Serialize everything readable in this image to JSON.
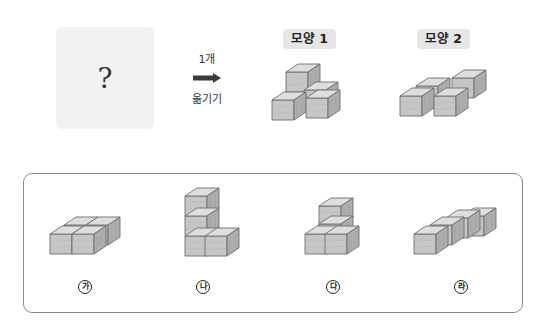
{
  "problem": {
    "question_box": {
      "text": "?"
    },
    "operation": {
      "count_label": "1개",
      "action_label": "옮기기",
      "arrow_icon": "right-arrow"
    },
    "shapes": [
      {
        "label": "모양 1"
      },
      {
        "label": "모양 2"
      }
    ]
  },
  "options": [
    {
      "marker": "가"
    },
    {
      "marker": "나"
    },
    {
      "marker": "다"
    },
    {
      "marker": "라"
    }
  ],
  "colors": {
    "cube_top": "#dcdcdc",
    "cube_front": "#c4c4c4",
    "cube_side": "#ababab",
    "cube_edge": "#6e6e6e",
    "badge_bg": "#e6e6e6",
    "question_bg": "#f2f2f2",
    "panel_border": "#8a8a8a"
  }
}
